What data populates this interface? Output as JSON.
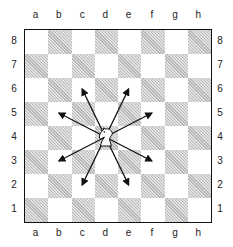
{
  "diagram": {
    "files": [
      "a",
      "b",
      "c",
      "d",
      "e",
      "f",
      "g",
      "h"
    ],
    "ranks": [
      "8",
      "7",
      "6",
      "5",
      "4",
      "3",
      "2",
      "1"
    ],
    "piece": {
      "type": "knight",
      "color": "white",
      "square": "d4"
    },
    "targets": [
      "c6",
      "e6",
      "b5",
      "f5",
      "b3",
      "f3",
      "c2",
      "e2"
    ],
    "colors": {
      "dark_square": "#b8b8b8",
      "light_square": "#ffffff",
      "border": "#111111",
      "arrow": "#111111"
    }
  }
}
